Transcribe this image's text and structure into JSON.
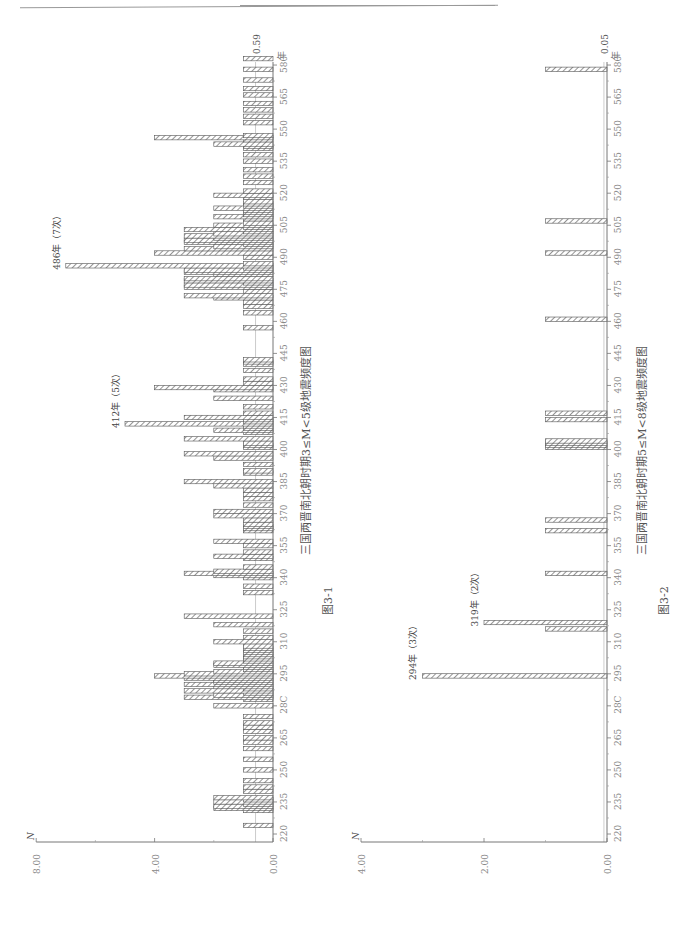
{
  "page": {
    "orientation": "rotated 90° counter-clockwise",
    "header_rule": true
  },
  "chart_data": [
    {
      "type": "bar",
      "orientation": "horizontal (page rotated)",
      "figure_label": "图3-1",
      "title": "三国两晋南北朝时期3≤M<5级地震频度图",
      "xlabel": "年",
      "ylabel": "N",
      "x_ticks": [
        220,
        235,
        250,
        265,
        280,
        295,
        310,
        325,
        340,
        355,
        370,
        385,
        400,
        415,
        430,
        445,
        460,
        475,
        490,
        505,
        520,
        535,
        550,
        565,
        580
      ],
      "x_tick_labels": [
        "220",
        "235",
        "250",
        "265",
        "28C",
        "295",
        "310",
        "325",
        "340",
        "355",
        "370",
        "385",
        "400",
        "415",
        "430",
        "445",
        "460",
        "475",
        "490",
        "505",
        "520",
        "535",
        "550",
        "565",
        "580"
      ],
      "y_ticks": [
        0,
        4,
        8
      ],
      "y_tick_labels": [
        "0.00",
        "4.00",
        "8.00"
      ],
      "ylim": [
        0,
        8
      ],
      "xlim": [
        220,
        590
      ],
      "mean_line": {
        "value": 0.59,
        "label": "0.59"
      },
      "annotations": [
        {
          "year": 412,
          "value": 5,
          "text": "412年（5次）"
        },
        {
          "year": 486,
          "value": 7,
          "text": "486年（7次）"
        }
      ],
      "series": [
        {
          "name": "frequency",
          "x": [
            224,
            231,
            232,
            233,
            234,
            235,
            236,
            237,
            240,
            242,
            245,
            250,
            255,
            260,
            263,
            265,
            268,
            270,
            272,
            275,
            280,
            283,
            284,
            285,
            286,
            287,
            288,
            289,
            290,
            291,
            292,
            293,
            294,
            295,
            296,
            297,
            298,
            299,
            300,
            301,
            302,
            303,
            304,
            305,
            306,
            307,
            308,
            310,
            312,
            315,
            318,
            322,
            333,
            336,
            340,
            341,
            342,
            343,
            345,
            349,
            350,
            352,
            355,
            357,
            362,
            363,
            364,
            365,
            367,
            369,
            371,
            374,
            377,
            379,
            381,
            383,
            385,
            389,
            390,
            393,
            396,
            398,
            401,
            402,
            403,
            405,
            408,
            409,
            410,
            411,
            412,
            413,
            414,
            415,
            417,
            420,
            424,
            428,
            429,
            431,
            433,
            437,
            440,
            441,
            442,
            457,
            464,
            467,
            469,
            471,
            472,
            474,
            476,
            477,
            478,
            479,
            480,
            482,
            483,
            484,
            485,
            486,
            487,
            490,
            492,
            494,
            495,
            496,
            497,
            498,
            499,
            500,
            501,
            502,
            503,
            504,
            505,
            506,
            508,
            509,
            510,
            511,
            512,
            513,
            514,
            515,
            516,
            518,
            519,
            521,
            525,
            528,
            531,
            535,
            538,
            541,
            542,
            543,
            545,
            546,
            547,
            553,
            556,
            559,
            562,
            566,
            569,
            573,
            578,
            583
          ],
          "values": [
            1,
            1,
            2,
            2,
            1,
            2,
            1,
            2,
            1,
            1,
            1,
            1,
            1,
            1,
            1,
            1,
            1,
            1,
            1,
            1,
            2,
            1,
            3,
            2,
            1,
            3,
            1,
            2,
            3,
            2,
            2,
            3,
            4,
            3,
            2,
            1,
            1,
            2,
            2,
            1,
            1,
            1,
            1,
            1,
            1,
            1,
            1,
            2,
            1,
            1,
            2,
            3,
            1,
            1,
            1,
            2,
            3,
            2,
            1,
            1,
            2,
            1,
            1,
            2,
            1,
            1,
            1,
            1,
            1,
            2,
            2,
            1,
            1,
            1,
            1,
            2,
            3,
            1,
            1,
            1,
            2,
            3,
            1,
            1,
            1,
            3,
            1,
            2,
            1,
            1,
            5,
            1,
            1,
            3,
            1,
            1,
            2,
            2,
            4,
            1,
            1,
            1,
            1,
            1,
            1,
            1,
            1,
            1,
            1,
            2,
            3,
            1,
            3,
            3,
            1,
            3,
            3,
            2,
            3,
            3,
            1,
            7,
            1,
            1,
            4,
            3,
            2,
            1,
            3,
            3,
            2,
            3,
            2,
            1,
            3,
            1,
            2,
            1,
            1,
            2,
            1,
            1,
            1,
            2,
            1,
            1,
            1,
            1,
            2,
            1,
            1,
            1,
            1,
            1,
            1,
            1,
            1,
            2,
            1,
            4,
            1,
            1,
            1,
            1,
            1,
            1,
            1,
            1,
            1,
            1,
            1
          ]
        }
      ]
    },
    {
      "type": "bar",
      "orientation": "horizontal (page rotated)",
      "figure_label": "图3-2",
      "title": "三国两晋南北朝时期5≤M<8级地震频度图",
      "xlabel": "年",
      "ylabel": "N",
      "x_ticks": [
        220,
        235,
        250,
        265,
        280,
        295,
        310,
        325,
        340,
        355,
        370,
        385,
        400,
        415,
        430,
        445,
        460,
        475,
        490,
        505,
        520,
        535,
        550,
        565,
        580
      ],
      "x_tick_labels": [
        "220",
        "235",
        "250",
        "265",
        "28C",
        "295",
        "310",
        "325",
        "340",
        "355",
        "370",
        "385",
        "400",
        "415",
        "430",
        "445",
        "460",
        "475",
        "490",
        "505",
        "520",
        "535",
        "550",
        "565",
        "580"
      ],
      "y_ticks": [
        0,
        2,
        4
      ],
      "y_tick_labels": [
        "0.00",
        "2.00",
        "4.00"
      ],
      "ylim": [
        0,
        4
      ],
      "xlim": [
        220,
        590
      ],
      "mean_line": {
        "value": 0.05,
        "label": "0.05"
      },
      "annotations": [
        {
          "year": 294,
          "value": 3,
          "text": "294年（3次）"
        },
        {
          "year": 319,
          "value": 2,
          "text": "319年（2次）"
        }
      ],
      "series": [
        {
          "name": "frequency",
          "x": [
            294,
            316,
            319,
            342,
            362,
            367,
            401,
            402,
            403,
            404,
            414,
            417,
            461,
            492,
            507,
            578
          ],
          "values": [
            3,
            1,
            2,
            1,
            1,
            1,
            1,
            1,
            1,
            1,
            1,
            1,
            1,
            1,
            1,
            1
          ]
        }
      ]
    }
  ]
}
